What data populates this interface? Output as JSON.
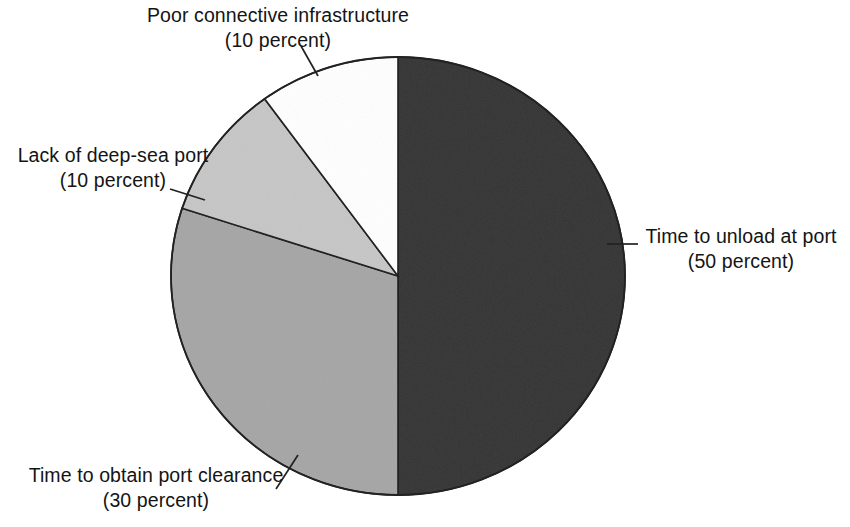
{
  "figure": {
    "background_color": "#ffffff",
    "text_color": "#141414"
  },
  "chart_data": {
    "type": "pie",
    "title": "",
    "subtitle": "",
    "xlabel": "",
    "ylabel": "",
    "legend_position": "none",
    "grid": false,
    "units": "percent",
    "total": 100,
    "start_angle_deg": 0,
    "direction": "clockwise",
    "categories": [
      "Time to unload at port",
      "Time to obtain port clearance",
      "Lack of deep-sea port",
      "Poor connective infrastructure"
    ],
    "values": [
      50,
      30,
      10,
      10
    ],
    "slices": [
      {
        "label": "Time to unload at port",
        "value": 50,
        "value_text": "(50 percent)",
        "color": "#3a3a3a",
        "start_deg": 0,
        "end_deg": 180
      },
      {
        "label": "Time to obtain port clearance",
        "value": 30,
        "value_text": "(30 percent)",
        "color": "#a8a8a8",
        "start_deg": 180,
        "end_deg": 288
      },
      {
        "label": "Lack of deep-sea port",
        "value": 10,
        "value_text": "(10 percent)",
        "color": "#c8c8c8",
        "start_deg": 288,
        "end_deg": 324
      },
      {
        "label": "Poor connective infrastructure",
        "value": 10,
        "value_text": "(10 percent)",
        "color": "#ffffff",
        "start_deg": 324,
        "end_deg": 360
      }
    ],
    "annotations": [
      "Poor connective infrastructure (10 percent)",
      "Lack of deep-sea port (10 percent)",
      "Time to unload at port (50 percent)",
      "Time to obtain port clearance (30 percent)"
    ]
  },
  "callouts": {
    "poor_connective_infrastructure": {
      "line1": "Poor connective infrastructure",
      "line2": "(10 percent)"
    },
    "lack_of_deep_sea_port": {
      "line1": "Lack of deep-sea port",
      "line2": "(10 percent)"
    },
    "time_to_unload_at_port": {
      "line1": "Time to unload at port",
      "line2": "(50 percent)"
    },
    "time_to_obtain_port_clearance": {
      "line1": "Time to obtain port clearance",
      "line2": "(30 percent)"
    }
  }
}
